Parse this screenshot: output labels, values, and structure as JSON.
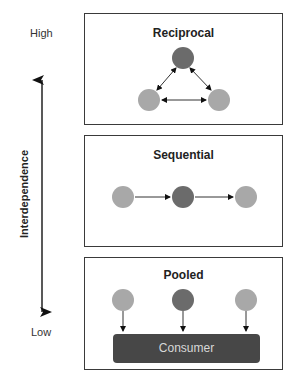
{
  "axis": {
    "title": "Interdependence",
    "high_label": "High",
    "low_label": "Low",
    "direction": "bidirectional-vertical"
  },
  "panels": [
    {
      "title": "Reciprocal",
      "nodes": [
        {
          "role": "focal",
          "color": "#6b6b6b"
        },
        {
          "role": "peer",
          "color": "#a8a8a8"
        },
        {
          "role": "peer",
          "color": "#a8a8a8"
        }
      ],
      "links": "bidirectional-triangle"
    },
    {
      "title": "Sequential",
      "nodes": [
        {
          "role": "peer",
          "color": "#a8a8a8"
        },
        {
          "role": "focal",
          "color": "#6b6b6b"
        },
        {
          "role": "peer",
          "color": "#a8a8a8"
        }
      ],
      "links": "left-to-right-chain"
    },
    {
      "title": "Pooled",
      "nodes": [
        {
          "role": "peer",
          "color": "#a8a8a8"
        },
        {
          "role": "focal",
          "color": "#6b6b6b"
        },
        {
          "role": "peer",
          "color": "#a8a8a8"
        }
      ],
      "links": "down-to-consumer",
      "consumer_label": "Consumer"
    }
  ],
  "colors": {
    "dark_node": "#6b6b6b",
    "light_node": "#a8a8a8",
    "consumer_bar": "#474747",
    "border": "#3a3a3a"
  }
}
